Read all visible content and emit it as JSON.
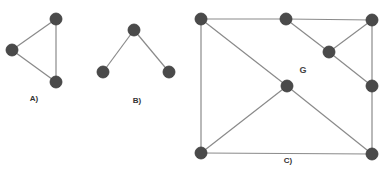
{
  "graphs": [
    {
      "id": "A",
      "caption": "A)",
      "caption_pos": [
        34,
        98
      ],
      "nodes": [
        [
          56,
          19
        ],
        [
          12,
          50
        ],
        [
          56,
          82
        ]
      ],
      "edges": [
        [
          0,
          1
        ],
        [
          1,
          2
        ],
        [
          0,
          2
        ]
      ]
    },
    {
      "id": "B",
      "caption": "B)",
      "caption_pos": [
        137,
        100
      ],
      "nodes": [
        [
          134,
          30
        ],
        [
          103,
          72
        ],
        [
          169,
          72
        ]
      ],
      "edges": [
        [
          0,
          1
        ],
        [
          0,
          2
        ]
      ]
    },
    {
      "id": "C",
      "caption": "C)",
      "caption_pos": [
        288,
        160
      ],
      "name": "G",
      "name_pos": [
        303,
        70
      ],
      "nodes": [
        [
          201,
          19
        ],
        [
          286,
          19
        ],
        [
          372,
          20
        ],
        [
          329,
          52
        ],
        [
          372,
          86
        ],
        [
          287,
          86
        ],
        [
          201,
          153
        ],
        [
          372,
          154
        ]
      ],
      "edges": [
        [
          0,
          1
        ],
        [
          1,
          2
        ],
        [
          1,
          3
        ],
        [
          2,
          3
        ],
        [
          3,
          4
        ],
        [
          2,
          4
        ],
        [
          4,
          7
        ],
        [
          0,
          6
        ],
        [
          0,
          5
        ],
        [
          5,
          6
        ],
        [
          5,
          7
        ],
        [
          6,
          7
        ]
      ]
    }
  ],
  "labels": {
    "a": "A)",
    "b": "B)",
    "c": "C)",
    "g": "G"
  },
  "colors": {
    "node": "#4a4a4a",
    "edge": "#8a8a8a",
    "background": "#ffffff"
  }
}
